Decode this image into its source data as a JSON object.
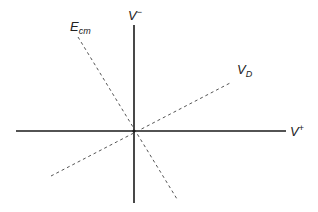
{
  "diagram": {
    "axes": {
      "horizontal": {
        "label_main": "V",
        "label_sup": "+",
        "x1": 16,
        "y1": 131,
        "x2": 286,
        "y2": 131,
        "color": "#1a1a1a",
        "stroke_width": 1.6
      },
      "vertical": {
        "label_main": "V",
        "label_sup": "−",
        "x1": 134,
        "y1": 25,
        "x2": 134,
        "y2": 203,
        "color": "#1a1a1a",
        "stroke_width": 1.6
      }
    },
    "dashed_lines": [
      {
        "name": "E_cm",
        "label_main": "E",
        "label_sub": "cm",
        "x1": 78,
        "y1": 37,
        "x2": 177,
        "y2": 199,
        "color": "#555555"
      },
      {
        "name": "V_D",
        "label_main": "V",
        "label_sub": "D",
        "x1": 51,
        "y1": 176,
        "x2": 232,
        "y2": 82,
        "color": "#555555"
      }
    ],
    "origin": {
      "x": 134,
      "y": 131
    }
  }
}
